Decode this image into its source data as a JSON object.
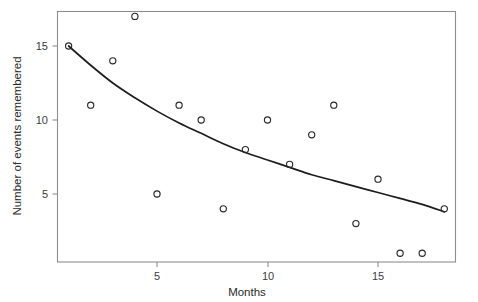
{
  "chart_data": {
    "type": "scatter",
    "title": "",
    "subtitle": "",
    "xlabel": "Months",
    "ylabel": "Number of events remembered",
    "xlim": [
      0,
      19
    ],
    "ylim": [
      0,
      18.3
    ],
    "xticks": [
      5,
      10,
      15
    ],
    "xticklabels": [
      "5",
      "10",
      "15"
    ],
    "yticks": [
      5,
      10,
      15
    ],
    "yticklabels": [
      "5",
      "10",
      "15"
    ],
    "grid": false,
    "legend": null,
    "x": [
      1,
      2,
      3,
      4,
      5,
      6,
      7,
      8,
      9,
      10,
      11,
      12,
      13,
      14,
      15,
      16,
      17,
      18
    ],
    "y": [
      15,
      11,
      14,
      17,
      5,
      11,
      10,
      4,
      8,
      10,
      7,
      9,
      11,
      3,
      6,
      1,
      1,
      4
    ],
    "points": [
      {
        "x": 1,
        "y": 15
      },
      {
        "x": 2,
        "y": 11
      },
      {
        "x": 3,
        "y": 14
      },
      {
        "x": 4,
        "y": 17
      },
      {
        "x": 5,
        "y": 5
      },
      {
        "x": 6,
        "y": 11
      },
      {
        "x": 7,
        "y": 10
      },
      {
        "x": 8,
        "y": 4
      },
      {
        "x": 9,
        "y": 8
      },
      {
        "x": 10,
        "y": 10
      },
      {
        "x": 11,
        "y": 7
      },
      {
        "x": 12,
        "y": 9
      },
      {
        "x": 13,
        "y": 11
      },
      {
        "x": 14,
        "y": 3
      },
      {
        "x": 15,
        "y": 6
      },
      {
        "x": 16,
        "y": 1
      },
      {
        "x": 17,
        "y": 1
      },
      {
        "x": 18,
        "y": 4
      }
    ],
    "marker": "open-circle",
    "marker_color": "#2a2a2a",
    "series": [
      {
        "name": "fitted-curve",
        "type": "line",
        "color": "#1d1d1d",
        "description": "smooth monotone decreasing fit",
        "x": [
          1,
          2,
          3,
          4,
          5,
          6,
          7,
          8,
          9,
          10,
          11,
          12,
          13,
          14,
          15,
          16,
          17,
          18
        ],
        "y": [
          15.0,
          13.7,
          12.5,
          11.5,
          10.6,
          9.8,
          9.1,
          8.4,
          7.8,
          7.3,
          6.8,
          6.3,
          5.9,
          5.5,
          5.1,
          4.7,
          4.3,
          3.8
        ]
      }
    ]
  },
  "axes": {
    "x_axis_title": "Months",
    "y_axis_title": "Number of events remembered"
  },
  "colors": {
    "frame": "#8e8e8e",
    "curve": "#1d1d1d",
    "marker": "#2a2a2a",
    "text": "#2b2b2b",
    "background": "#ffffff"
  }
}
